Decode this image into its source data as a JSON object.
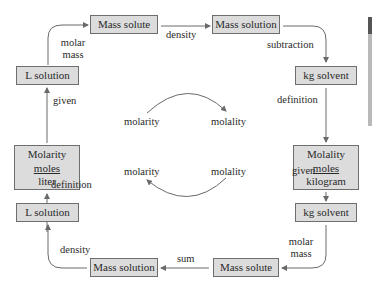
{
  "boxes": {
    "top_mass_solute": "Mass solute",
    "top_mass_solution": "Mass solution",
    "top_l_solution": "L solution",
    "top_kg_solvent": "kg solvent",
    "molarity": {
      "title": "Molarity",
      "numerator": "moles",
      "denominator": "liter"
    },
    "molality": {
      "title": "Molality",
      "numerator": "moles",
      "denominator": "kilogram"
    },
    "bottom_l_solution": "L solution",
    "bottom_kg_solvent": "kg solvent",
    "bottom_mass_solution": "Mass solution",
    "bottom_mass_solute": "Mass solute"
  },
  "edge_labels": {
    "molar_mass_top_1": "molar",
    "molar_mass_top_2": "mass",
    "density_top": "density",
    "subtraction": "subtraction",
    "given_left": "given",
    "definition_right": "definition",
    "definition_left": "definition",
    "given_right": "given",
    "density_bottom": "density",
    "sum": "sum",
    "molar_mass_bottom_1": "molar",
    "molar_mass_bottom_2": "mass"
  },
  "center": {
    "top_left": "molarity",
    "top_right": "molality",
    "bottom_left": "molarity",
    "bottom_right": "molality"
  },
  "colors": {
    "box_fill": "#dcdcdc",
    "box_border": "#6e6e6e",
    "arrow": "#6a6a6a",
    "text": "#2a2a2a"
  }
}
